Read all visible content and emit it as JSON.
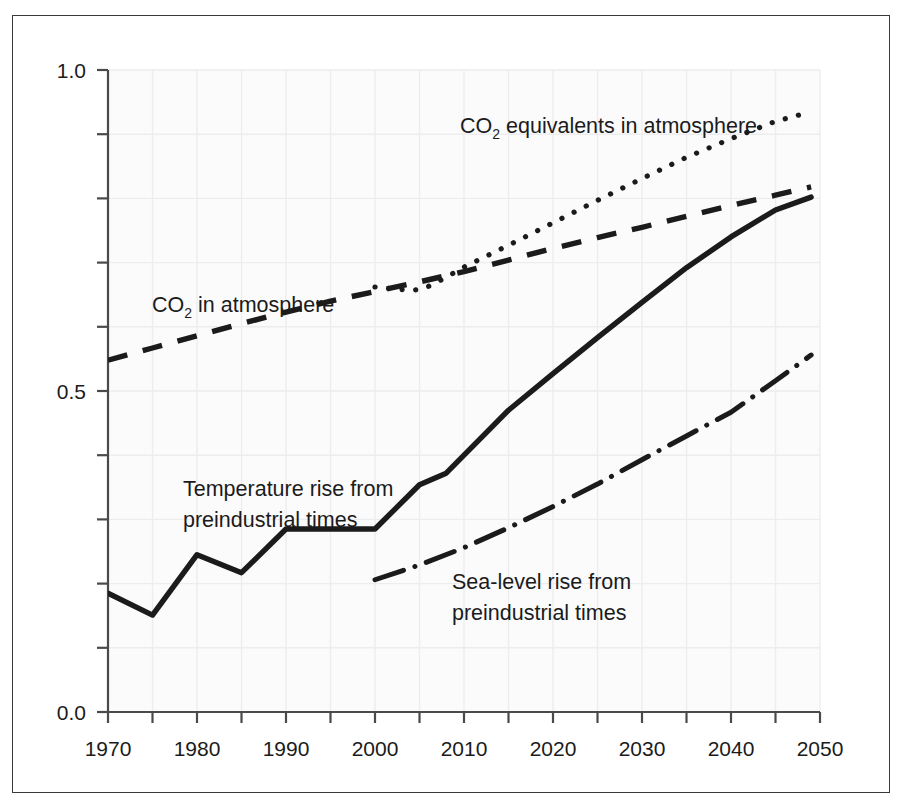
{
  "figure": {
    "background_color": "#ffffff",
    "frame_color": "#3a3a3a",
    "line_color": "#1b1b1b",
    "grid_color": "#ededf0",
    "plot_background": "#fbfbfc"
  },
  "axes": {
    "x_tick_labels": [
      "1970",
      "1980",
      "1990",
      "2000",
      "2010",
      "2020",
      "2030",
      "2040",
      "2050"
    ],
    "x_minor_ticks": [
      "1975",
      "1985",
      "1995",
      "2005",
      "2015",
      "2025",
      "2035",
      "2045"
    ],
    "y_tick_labels": [
      "0.0",
      "0.5",
      "1.0"
    ],
    "xlim_min": "1970",
    "xlim_max": "2050",
    "ylim_min": "0.0",
    "ylim_max": "1.0"
  },
  "labels": {
    "co2_equivalents": {
      "prefix": "CO",
      "sub": "2",
      "suffix": " equivalents in atmosphere"
    },
    "co2": {
      "prefix": "CO",
      "sub": "2",
      "suffix": " in atmosphere"
    },
    "temperature_line1": "Temperature rise from",
    "temperature_line2": "preindustrial times",
    "sealevel_line1": "Sea-level rise from",
    "sealevel_line2": "preindustrial times"
  },
  "chart_data": {
    "type": "line",
    "title": "",
    "xlabel": "",
    "ylabel": "",
    "xlim": [
      1970,
      2050
    ],
    "ylim": [
      0.0,
      1.0
    ],
    "grid": true,
    "legend": "inline-annotations",
    "x_ticks": [
      1970,
      1975,
      1980,
      1985,
      1990,
      1995,
      2000,
      2005,
      2010,
      2015,
      2020,
      2025,
      2030,
      2035,
      2040,
      2045,
      2050
    ],
    "x_tick_labels": [
      1970,
      1980,
      1990,
      2000,
      2010,
      2020,
      2030,
      2040,
      2050
    ],
    "y_ticks": [
      0.0,
      0.1,
      0.2,
      0.3,
      0.4,
      0.5,
      0.6,
      0.7,
      0.8,
      0.9,
      1.0
    ],
    "y_tick_labels": [
      0.0,
      0.5,
      1.0
    ],
    "series": [
      {
        "name": "CO2 equivalents in atmosphere",
        "style": "dotted",
        "x": [
          2000,
          2002,
          2004,
          2005,
          2006,
          2008,
          2010,
          2015,
          2020,
          2025,
          2030,
          2035,
          2040,
          2045,
          2049
        ],
        "values": [
          0.662,
          0.659,
          0.657,
          0.658,
          0.663,
          0.677,
          0.693,
          0.727,
          0.762,
          0.797,
          0.831,
          0.864,
          0.893,
          0.92,
          0.935
        ]
      },
      {
        "name": "CO2 in atmosphere",
        "style": "dashed",
        "x": [
          1970,
          1975,
          1980,
          1985,
          1990,
          1995,
          2000,
          2005,
          2010,
          2015,
          2020,
          2025,
          2030,
          2035,
          2040,
          2045,
          2049
        ],
        "values": [
          0.548,
          0.567,
          0.586,
          0.605,
          0.623,
          0.64,
          0.655,
          0.67,
          0.686,
          0.704,
          0.722,
          0.739,
          0.755,
          0.772,
          0.789,
          0.805,
          0.818
        ]
      },
      {
        "name": "Temperature rise from preindustrial times",
        "style": "solid",
        "x": [
          1970,
          1975,
          1980,
          1985,
          1990,
          1995,
          2000,
          2005,
          2008,
          2015,
          2020,
          2025,
          2030,
          2035,
          2040,
          2045,
          2049
        ],
        "values": [
          0.185,
          0.151,
          0.245,
          0.217,
          0.285,
          0.285,
          0.285,
          0.354,
          0.372,
          0.47,
          0.527,
          0.583,
          0.638,
          0.692,
          0.74,
          0.782,
          0.802
        ]
      },
      {
        "name": "Sea-level rise from preindustrial times",
        "style": "dash-dot",
        "x": [
          2000,
          2005,
          2010,
          2015,
          2020,
          2025,
          2030,
          2035,
          2040,
          2045,
          2049
        ],
        "values": [
          0.206,
          0.229,
          0.256,
          0.287,
          0.32,
          0.355,
          0.393,
          0.43,
          0.467,
          0.516,
          0.556
        ]
      }
    ],
    "annotations": [
      {
        "text": "CO2 equivalents in atmosphere",
        "x": 2013,
        "y": 0.875
      },
      {
        "text": "CO2 in atmosphere",
        "x": 1978,
        "y": 0.645
      },
      {
        "text": "Temperature rise from preindustrial times",
        "x": 1981,
        "y": 0.355
      },
      {
        "text": "Sea-level rise from preindustrial times",
        "x": 2019,
        "y": 0.195
      }
    ]
  }
}
